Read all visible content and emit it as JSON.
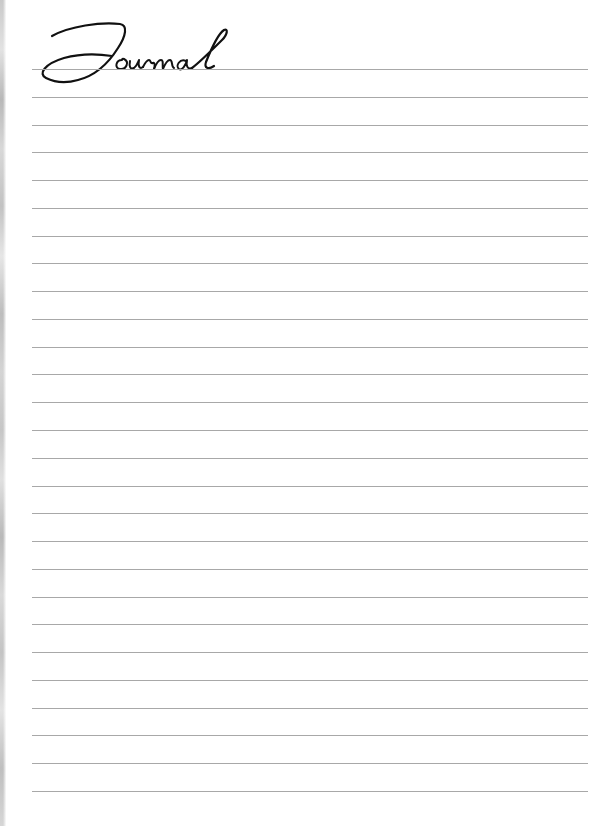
{
  "page": {
    "title": "Journal",
    "ruled_line_count": 27,
    "first_line_y": 69,
    "line_spacing_px": 27.77,
    "line_color": "#a8a8a8",
    "title_color": "#111111",
    "edge_texture": "gray-marble"
  }
}
